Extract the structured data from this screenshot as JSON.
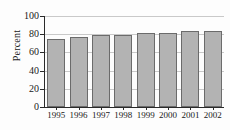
{
  "chart_data": {
    "type": "bar",
    "title": "",
    "subtitle": "",
    "xlabel": "",
    "ylabel": "Percent",
    "categories": [
      "1995",
      "1996",
      "1997",
      "1998",
      "1999",
      "2000",
      "2001",
      "2002"
    ],
    "values": [
      75,
      77,
      79,
      79,
      81,
      81,
      83,
      84
    ],
    "series": [
      {
        "name": "Percent",
        "values": [
          75,
          77,
          79,
          79,
          81,
          81,
          83,
          84
        ]
      }
    ],
    "ylim": [
      0,
      100
    ],
    "yticks": [
      0,
      20,
      40,
      60,
      80,
      100
    ],
    "ytick_labels": [
      "0",
      "20",
      "40",
      "60",
      "80",
      "100"
    ],
    "xtick_labels": [
      "1995",
      "1996",
      "1997",
      "1998",
      "1999",
      "2000",
      "2001",
      "2002"
    ],
    "grid": true,
    "grid_axis": "y",
    "legend": false,
    "legend_position": "none",
    "bar_fill_color": "#b3b3b3",
    "bar_edge_color": "#6b6b6b",
    "axis_color": "#2a2a2a",
    "grid_color": "#c9c9c9",
    "background_color": "#fdfdfd"
  }
}
